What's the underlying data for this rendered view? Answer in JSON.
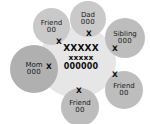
{
  "diagram": {
    "background_color": "#ffffff",
    "core": {
      "name": "core-cluster",
      "fill": "#e6e6e6",
      "line_1": "XXXXX",
      "line_2": "xxxxx",
      "line_3": "000000"
    },
    "members": [
      {
        "id": "friend-top-left",
        "label": "Friend",
        "zeros": "00",
        "mark": "X",
        "fill": "#c9c9c9"
      },
      {
        "id": "dad",
        "label": "Dad",
        "zeros": "000",
        "mark": "X",
        "fill": "#c9c9c9"
      },
      {
        "id": "sibling",
        "label": "Sibling",
        "zeros": "000",
        "mark": "X",
        "fill": "#bdbdbd"
      },
      {
        "id": "mom",
        "label": "Mom",
        "zeros": "000",
        "mark": "X",
        "fill": "#b0b0b0"
      },
      {
        "id": "friend-bottom-right",
        "label": "Friend",
        "zeros": "00",
        "mark": "X",
        "fill": "#bdbdbd"
      },
      {
        "id": "friend-bottom",
        "label": "Friend",
        "zeros": "00",
        "mark": "X",
        "fill": "#bdbdbd"
      }
    ]
  }
}
